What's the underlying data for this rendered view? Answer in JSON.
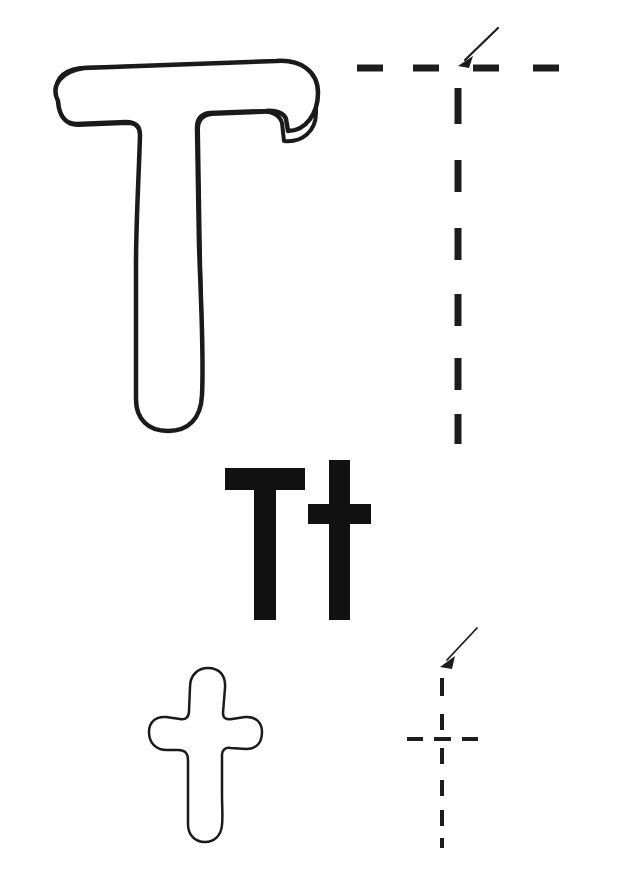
{
  "worksheet": {
    "letter_uppercase": "T",
    "letter_lowercase": "t",
    "letter_pair": "Tt",
    "background_color": "#ffffff",
    "ink_color": "#111111",
    "outline_color": "#1a1a1a"
  },
  "sections": {
    "outline_uppercase": {
      "name": "outline-letter-T",
      "glyph": "T",
      "style": "bubble-outline",
      "fill": "#ffffff",
      "stroke": "#1a1a1a",
      "stroke_width": 4
    },
    "guide_uppercase": {
      "name": "dashed-guide-T",
      "glyph": "T",
      "style": "dashed-trace",
      "color": "#1d1d1d",
      "horizontal_dash_count": 4,
      "vertical_dash_count": 6,
      "dash_thickness": 7,
      "arrow": {
        "name": "start-arrow",
        "direction": "down-left",
        "points_to": "top-crossbar-center"
      }
    },
    "bold_pair": {
      "name": "bold-letters-Tt",
      "glyph": "Tt",
      "style": "solid-bold",
      "color": "#111111",
      "letters": [
        {
          "char": "T",
          "case": "uppercase"
        },
        {
          "char": "t",
          "case": "lowercase"
        }
      ]
    },
    "outline_lowercase": {
      "name": "outline-letter-t",
      "glyph": "t",
      "style": "bubble-outline",
      "fill": "#ffffff",
      "stroke": "#1a1a1a",
      "stroke_width": 2.5
    },
    "guide_lowercase": {
      "name": "dashed-guide-t",
      "glyph": "t",
      "style": "dashed-trace",
      "color": "#1d1d1d",
      "vertical_dash_count": 6,
      "horizontal_dash_count": 3,
      "dash_thickness": 4,
      "arrow": {
        "name": "start-arrow",
        "direction": "down-left",
        "points_to": "stem-top"
      }
    }
  }
}
